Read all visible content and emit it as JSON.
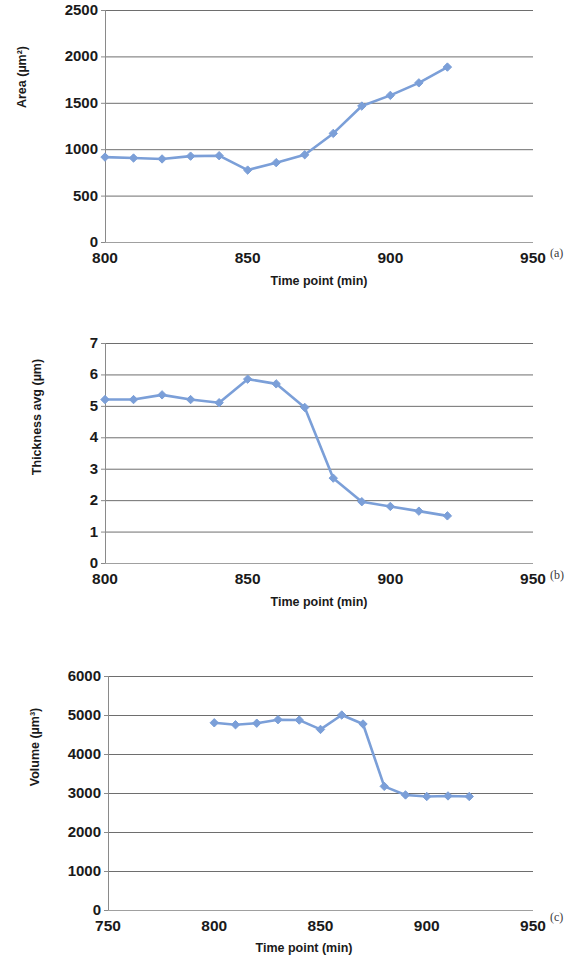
{
  "figure": {
    "panels": [
      {
        "letter": "(a)",
        "ylabel": "Area (µm²)",
        "xlabel": "Time point (min)",
        "yticks": [
          "0",
          "500",
          "1000",
          "1500",
          "2000",
          "2500"
        ],
        "xticks": [
          "800",
          "850",
          "900",
          "950"
        ]
      },
      {
        "letter": "(b)",
        "ylabel": "Thickness avg (µm)",
        "xlabel": "Time point (min)",
        "yticks": [
          "0",
          "1",
          "2",
          "3",
          "4",
          "5",
          "6",
          "7"
        ],
        "xticks": [
          "800",
          "850",
          "900",
          "950"
        ]
      },
      {
        "letter": "(c)",
        "ylabel": "Volume (µm³)",
        "xlabel": "Time point (min)",
        "yticks": [
          "0",
          "1000",
          "2000",
          "3000",
          "4000",
          "5000",
          "6000"
        ],
        "xticks": [
          "750",
          "800",
          "850",
          "900",
          "950"
        ]
      }
    ]
  },
  "style": {
    "series_color": "#7b9fd8",
    "marker_color": "#7b9fd8",
    "grid_color": "#6e6e6e",
    "text_color": "#1a1a1a"
  },
  "chart_data": [
    {
      "type": "line",
      "title": "",
      "panel": "(a)",
      "xlabel": "Time point (min)",
      "ylabel": "Area (µm²)",
      "xlim": [
        800,
        950
      ],
      "ylim": [
        0,
        2500
      ],
      "xticks": [
        800,
        850,
        900,
        950
      ],
      "yticks": [
        0,
        500,
        1000,
        1500,
        2000,
        2500
      ],
      "grid": "horizontal",
      "legend": "none",
      "x": [
        800,
        810,
        820,
        830,
        840,
        850,
        860,
        870,
        880,
        890,
        900,
        910,
        920
      ],
      "values": [
        915,
        905,
        895,
        925,
        930,
        775,
        855,
        940,
        1170,
        1465,
        1580,
        1715,
        1885
      ]
    },
    {
      "type": "line",
      "title": "",
      "panel": "(b)",
      "xlabel": "Time point (min)",
      "ylabel": "Thickness avg (µm)",
      "xlim": [
        800,
        950
      ],
      "ylim": [
        0,
        7
      ],
      "xticks": [
        800,
        850,
        900,
        950
      ],
      "yticks": [
        0,
        1,
        2,
        3,
        4,
        5,
        6,
        7
      ],
      "grid": "horizontal",
      "legend": "none",
      "x": [
        800,
        810,
        820,
        830,
        840,
        850,
        860,
        870,
        880,
        890,
        900,
        910,
        920
      ],
      "values": [
        5.2,
        5.2,
        5.35,
        5.2,
        5.1,
        5.85,
        5.7,
        4.95,
        2.7,
        1.95,
        1.8,
        1.65,
        1.5
      ]
    },
    {
      "type": "line",
      "title": "",
      "panel": "(c)",
      "xlabel": "Time point (min)",
      "ylabel": "Volume (µm³)",
      "xlim": [
        750,
        950
      ],
      "ylim": [
        0,
        6000
      ],
      "xticks": [
        750,
        800,
        850,
        900,
        950
      ],
      "yticks": [
        0,
        1000,
        2000,
        3000,
        4000,
        5000,
        6000
      ],
      "grid": "horizontal",
      "legend": "none",
      "x": [
        800,
        810,
        820,
        830,
        840,
        850,
        860,
        870,
        880,
        890,
        900,
        910,
        920
      ],
      "values": [
        4800,
        4750,
        4790,
        4880,
        4870,
        4630,
        5000,
        4770,
        3170,
        2950,
        2910,
        2925,
        2910
      ]
    }
  ]
}
